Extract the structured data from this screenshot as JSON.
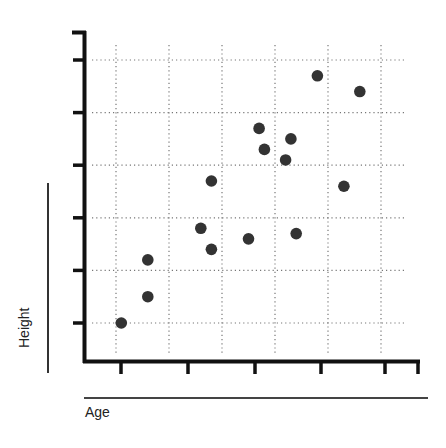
{
  "chart_data": {
    "type": "scatter",
    "title": "",
    "xlabel": "Age",
    "ylabel": "Height",
    "xlim": [
      0.1,
      6.7
    ],
    "ylim": [
      0.3,
      6.5
    ],
    "grid": true,
    "grid_style": "dotted",
    "legend": null,
    "x_tick_labels": [],
    "y_tick_labels": [],
    "marker_color": "#333333",
    "series": [
      {
        "name": "points",
        "points": [
          {
            "x": 1.1,
            "y": 1.0
          },
          {
            "x": 1.6,
            "y": 1.5
          },
          {
            "x": 1.6,
            "y": 2.2
          },
          {
            "x": 2.6,
            "y": 2.8
          },
          {
            "x": 2.8,
            "y": 2.4
          },
          {
            "x": 2.8,
            "y": 3.7
          },
          {
            "x": 3.5,
            "y": 2.6
          },
          {
            "x": 3.7,
            "y": 4.7
          },
          {
            "x": 3.8,
            "y": 4.3
          },
          {
            "x": 4.2,
            "y": 4.1
          },
          {
            "x": 4.3,
            "y": 4.5
          },
          {
            "x": 4.4,
            "y": 2.7
          },
          {
            "x": 4.8,
            "y": 5.7
          },
          {
            "x": 5.3,
            "y": 3.6
          },
          {
            "x": 5.6,
            "y": 5.4
          }
        ]
      }
    ]
  },
  "labels": {
    "x": "Age",
    "y": "Height"
  }
}
